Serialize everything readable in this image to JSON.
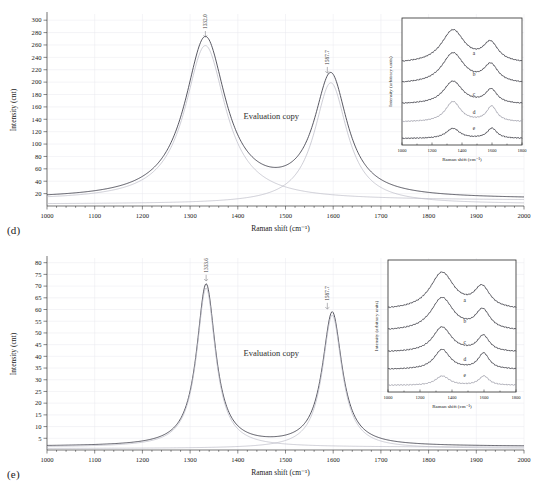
{
  "figure": {
    "panels": [
      {
        "id": "d",
        "label": "(d)",
        "watermark": "Evaluation copy",
        "xlabel": "Raman shift (cm⁻¹)",
        "ylabel": "Intensity (cnt)",
        "peak_labels": [
          "1332.0",
          "1587.7"
        ],
        "inset": {
          "xlabel": "Raman shift (cm⁻¹)",
          "ylabel": "Intensity (arbitrary units)",
          "curve_labels": [
            "a",
            "b",
            "c",
            "d",
            "e"
          ],
          "xticks": [
            "1000",
            "1200",
            "1400",
            "1600",
            "1800"
          ]
        }
      },
      {
        "id": "e",
        "label": "(e)",
        "watermark": "Evaluation copy",
        "xlabel": "Raman shift (cm⁻¹)",
        "ylabel": "Intensity (cnt)",
        "peak_labels": [
          "1333.6",
          "1587.7"
        ],
        "inset": {
          "xlabel": "Raman shift (cm⁻¹)",
          "ylabel": "Intensity (arbitrary units)",
          "curve_labels": [
            "a",
            "b",
            "c",
            "d",
            "e"
          ],
          "xticks": [
            "1000",
            "1200",
            "1400",
            "1600",
            "1800"
          ]
        }
      }
    ]
  },
  "chart_data": [
    {
      "type": "line",
      "panel": "d",
      "title": "",
      "xlabel": "Raman shift (cm⁻¹)",
      "ylabel": "Intensity (cnt)",
      "xlim": [
        1000,
        2000
      ],
      "ylim": [
        0,
        310
      ],
      "xticks": [
        1000,
        1100,
        1200,
        1300,
        1400,
        1500,
        1600,
        1700,
        1800,
        1900,
        2000
      ],
      "yticks": [
        20,
        40,
        60,
        80,
        100,
        120,
        140,
        160,
        180,
        200,
        220,
        240,
        260,
        280,
        300
      ],
      "grid": true,
      "legend": "none",
      "annotations": [
        {
          "text": "1332.0",
          "x": 1332.0,
          "y": 268,
          "rotation": -90
        },
        {
          "text": "1587.7",
          "x": 1587.7,
          "y": 210,
          "rotation": -90
        },
        {
          "text": "Evaluation copy",
          "x": 1470,
          "y": 140,
          "rotation": 0
        }
      ],
      "series": [
        {
          "name": "fitted-total",
          "style": "solid-dark",
          "peaks": [
            {
              "center": 1332.0,
              "amplitude": 258,
              "hwhm": 52
            },
            {
              "center": 1595.0,
              "amplitude": 195,
              "hwhm": 42
            }
          ],
          "baseline": 11
        },
        {
          "name": "component-D-band",
          "style": "solid-light",
          "peaks": [
            {
              "center": 1332.0,
              "amplitude": 250,
              "hwhm": 52
            }
          ],
          "baseline": 9
        },
        {
          "name": "component-G-band",
          "style": "solid-light",
          "peaks": [
            {
              "center": 1595.0,
              "amplitude": 196,
              "hwhm": 42
            }
          ],
          "baseline": 3
        }
      ]
    },
    {
      "type": "line",
      "panel": "e",
      "title": "",
      "xlabel": "Raman shift (cm⁻¹)",
      "ylabel": "Intensity (cnt)",
      "xlim": [
        1000,
        2000
      ],
      "ylim": [
        0,
        82
      ],
      "xticks": [
        1000,
        1100,
        1200,
        1300,
        1400,
        1500,
        1600,
        1700,
        1800,
        1900,
        2000
      ],
      "yticks": [
        5,
        10,
        15,
        20,
        25,
        30,
        35,
        40,
        45,
        50,
        55,
        60,
        65,
        70,
        75,
        80
      ],
      "grid": true,
      "legend": "none",
      "annotations": [
        {
          "text": "1333.6",
          "x": 1333.6,
          "y": 71,
          "rotation": -90
        },
        {
          "text": "1587.7",
          "x": 1587.7,
          "y": 59,
          "rotation": -90
        },
        {
          "text": "Evaluation copy",
          "x": 1470,
          "y": 40,
          "rotation": 0
        }
      ],
      "series": [
        {
          "name": "fitted-total",
          "style": "solid-dark",
          "peaks": [
            {
              "center": 1333.6,
              "amplitude": 69,
              "hwhm": 24
            },
            {
              "center": 1598.0,
              "amplitude": 57,
              "hwhm": 25
            }
          ],
          "baseline": 1.5
        },
        {
          "name": "component-D-band",
          "style": "solid-light",
          "peaks": [
            {
              "center": 1333.6,
              "amplitude": 68,
              "hwhm": 24
            }
          ],
          "baseline": 1.2
        },
        {
          "name": "component-G-band",
          "style": "solid-light",
          "peaks": [
            {
              "center": 1598.0,
              "amplitude": 57,
              "hwhm": 25
            }
          ],
          "baseline": 0.6
        }
      ]
    },
    {
      "type": "line",
      "panel": "d-inset",
      "title": "",
      "xlabel": "Raman shift (cm⁻¹)",
      "ylabel": "Intensity (arbitrary units)",
      "xlim": [
        1000,
        1800
      ],
      "ylim": [
        0,
        100
      ],
      "xticks": [
        1000,
        1200,
        1400,
        1600,
        1800
      ],
      "yticks": [],
      "grid": false,
      "legend": "inline-labels",
      "series": [
        {
          "name": "a",
          "offset": 64,
          "d_amp": 26,
          "g_amp": 15,
          "d_center": 1340,
          "g_center": 1590,
          "d_width": 95,
          "g_width": 62,
          "style": "dark"
        },
        {
          "name": "b",
          "offset": 48,
          "d_amp": 24,
          "g_amp": 14,
          "d_center": 1340,
          "g_center": 1592,
          "d_width": 90,
          "g_width": 58,
          "style": "dark"
        },
        {
          "name": "c",
          "offset": 32,
          "d_amp": 18,
          "g_amp": 11,
          "d_center": 1340,
          "g_center": 1595,
          "d_width": 78,
          "g_width": 48,
          "style": "dark"
        },
        {
          "name": "d",
          "offset": 18,
          "d_amp": 16,
          "g_amp": 12,
          "d_center": 1340,
          "g_center": 1598,
          "d_width": 62,
          "g_width": 42,
          "style": "light"
        },
        {
          "name": "e",
          "offset": 5,
          "d_amp": 8,
          "g_amp": 8,
          "d_center": 1340,
          "g_center": 1600,
          "d_width": 55,
          "g_width": 40,
          "style": "dark"
        }
      ]
    },
    {
      "type": "line",
      "panel": "e-inset",
      "title": "",
      "xlabel": "Raman shift (cm⁻¹)",
      "ylabel": "Intensity (arbitrary units)",
      "xlim": [
        1000,
        1800
      ],
      "ylim": [
        0,
        100
      ],
      "xticks": [
        1000,
        1200,
        1400,
        1600,
        1800
      ],
      "yticks": [],
      "grid": false,
      "legend": "inline-labels",
      "series": [
        {
          "name": "a",
          "offset": 62,
          "d_amp": 28,
          "g_amp": 16,
          "d_center": 1338,
          "g_center": 1588,
          "d_width": 92,
          "g_width": 60,
          "style": "dark"
        },
        {
          "name": "b",
          "offset": 46,
          "d_amp": 25,
          "g_amp": 15,
          "d_center": 1338,
          "g_center": 1592,
          "d_width": 86,
          "g_width": 55,
          "style": "dark"
        },
        {
          "name": "c",
          "offset": 30,
          "d_amp": 19,
          "g_amp": 12,
          "d_center": 1338,
          "g_center": 1596,
          "d_width": 72,
          "g_width": 46,
          "style": "dark"
        },
        {
          "name": "d",
          "offset": 17,
          "d_amp": 15,
          "g_amp": 12,
          "d_center": 1338,
          "g_center": 1598,
          "d_width": 60,
          "g_width": 42,
          "style": "dark"
        },
        {
          "name": "e",
          "offset": 5,
          "d_amp": 7,
          "g_amp": 7,
          "d_center": 1340,
          "g_center": 1600,
          "d_width": 52,
          "g_width": 38,
          "style": "light"
        }
      ]
    }
  ]
}
